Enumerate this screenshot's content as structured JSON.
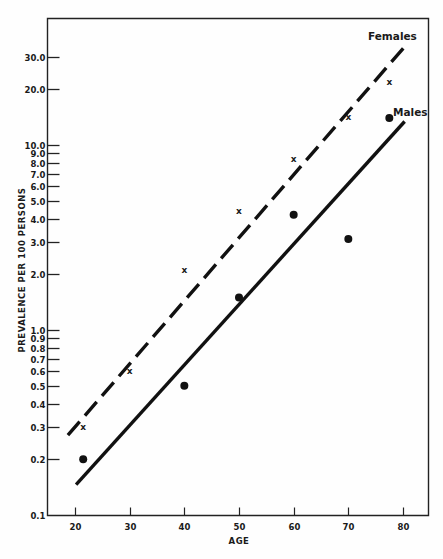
{
  "chart_data": {
    "type": "scatter",
    "title": "",
    "xlabel": "AGE",
    "ylabel": "PREVALENCE PER 100 PERSONS",
    "yscale": "log",
    "xlim": [
      15,
      85
    ],
    "ylim": [
      0.1,
      50
    ],
    "grid": false,
    "x_ticks": [
      20,
      30,
      40,
      50,
      60,
      70,
      80
    ],
    "y_ticks": [
      {
        "value": 0.1,
        "label": "0.1"
      },
      {
        "value": 0.2,
        "label": "0.2"
      },
      {
        "value": 0.3,
        "label": "0.3"
      },
      {
        "value": 0.4,
        "label": "0.4"
      },
      {
        "value": 0.5,
        "label": "0.5"
      },
      {
        "value": 0.6,
        "label": "0.6"
      },
      {
        "value": 0.7,
        "label": "0.7"
      },
      {
        "value": 0.8,
        "label": "0.8"
      },
      {
        "value": 0.9,
        "label": "0.9"
      },
      {
        "value": 1.0,
        "label": "1.0"
      },
      {
        "value": 2.0,
        "label": "2.0"
      },
      {
        "value": 3.0,
        "label": "3.0"
      },
      {
        "value": 4.0,
        "label": "4.0"
      },
      {
        "value": 5.0,
        "label": "5.0"
      },
      {
        "value": 6.0,
        "label": "6.0"
      },
      {
        "value": 7.0,
        "label": "7.0"
      },
      {
        "value": 8.0,
        "label": "8.0"
      },
      {
        "value": 9.0,
        "label": "9.0"
      },
      {
        "value": 10.0,
        "label": "10.0"
      },
      {
        "value": 20.0,
        "label": "20.0"
      },
      {
        "value": 30.0,
        "label": "30.0"
      }
    ],
    "series": [
      {
        "name": "Females",
        "marker": "x",
        "line_style": "dashed",
        "points": [
          {
            "x": 21.5,
            "y": 0.3
          },
          {
            "x": 30,
            "y": 0.6
          },
          {
            "x": 40,
            "y": 2.1
          },
          {
            "x": 50,
            "y": 4.4
          },
          {
            "x": 60,
            "y": 8.4
          },
          {
            "x": 70,
            "y": 14.2
          },
          {
            "x": 77.5,
            "y": 22.0
          }
        ],
        "fit_line": {
          "x0": 18.7,
          "y0": 0.27,
          "x1": 80.3,
          "y1": 34.0
        }
      },
      {
        "name": "Males",
        "marker": "filled-circle",
        "line_style": "solid",
        "points": [
          {
            "x": 21.5,
            "y": 0.2
          },
          {
            "x": 40,
            "y": 0.5
          },
          {
            "x": 50,
            "y": 1.5
          },
          {
            "x": 60,
            "y": 4.2
          },
          {
            "x": 70,
            "y": 3.1
          },
          {
            "x": 77.5,
            "y": 14.0
          }
        ],
        "fit_line": {
          "x0": 20.2,
          "y0": 0.146,
          "x1": 80.3,
          "y1": 13.4
        }
      }
    ],
    "legend": "inline labels near line ends (top right)"
  },
  "labels": {
    "females": "Females",
    "males": "Males",
    "xlabel": "AGE",
    "ylabel": "PREVALENCE PER 100 PERSONS"
  }
}
